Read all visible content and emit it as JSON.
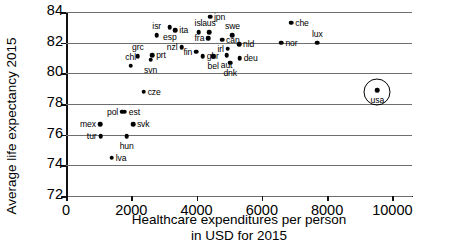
{
  "chart_data": {
    "type": "scatter",
    "title": "",
    "xlabel": "Healthcare expenditures per person in USD for 2015",
    "xlabel_line1": "Healthcare expenditures per person",
    "xlabel_line2": "in USD for 2015",
    "ylabel": "Average life expectancy 2015",
    "xlim": [
      0,
      10600
    ],
    "ylim": [
      72,
      84
    ],
    "xticks": [
      0,
      2000,
      4000,
      6000,
      8000,
      10000
    ],
    "xticklabels": [
      "0",
      "2000",
      "4000",
      "6000",
      "8000",
      "10000"
    ],
    "yticks": [
      72,
      74,
      76,
      78,
      80,
      82,
      84
    ],
    "yticklabels": [
      "72",
      "74",
      "76",
      "78",
      "80",
      "82",
      "84"
    ],
    "grid": "horizontal",
    "legend": "none",
    "marker_color": "#000000",
    "gridline_color": "#6e6e6e",
    "highlight": {
      "label": "usa",
      "x": 9540,
      "y": 78.9,
      "shape": "circle-annotation"
    },
    "points": [
      {
        "label": "tur",
        "x": 1060,
        "y": 75.9,
        "lpos": "left"
      },
      {
        "label": "mex",
        "x": 1040,
        "y": 76.7,
        "lpos": "left"
      },
      {
        "label": "lva",
        "x": 1400,
        "y": 74.5,
        "lpos": "right"
      },
      {
        "label": "pol",
        "x": 1720,
        "y": 77.5,
        "lpos": "left"
      },
      {
        "label": "est",
        "x": 1800,
        "y": 77.5,
        "lpos": "right"
      },
      {
        "label": "hun",
        "x": 1860,
        "y": 75.9,
        "lpos": "bottom"
      },
      {
        "label": "svk",
        "x": 2050,
        "y": 76.7,
        "lpos": "right"
      },
      {
        "label": "chl",
        "x": 1980,
        "y": 80.5,
        "lpos": "top"
      },
      {
        "label": "cze",
        "x": 2380,
        "y": 78.8,
        "lpos": "right"
      },
      {
        "label": "grc",
        "x": 2200,
        "y": 81.1,
        "lpos": "top"
      },
      {
        "label": "svn",
        "x": 2590,
        "y": 80.9,
        "lpos": "bottom"
      },
      {
        "label": "prt",
        "x": 2640,
        "y": 81.2,
        "lpos": "right"
      },
      {
        "label": "isr",
        "x": 2780,
        "y": 82.5,
        "lpos": "top"
      },
      {
        "label": "esp",
        "x": 3180,
        "y": 83.0,
        "lpos": "bottom"
      },
      {
        "label": "ita",
        "x": 3350,
        "y": 82.8,
        "lpos": "right"
      },
      {
        "label": "nzl",
        "x": 3540,
        "y": 81.7,
        "lpos": "left"
      },
      {
        "label": "fin",
        "x": 3990,
        "y": 81.4,
        "lpos": "left"
      },
      {
        "label": "isl",
        "x": 4060,
        "y": 82.7,
        "lpos": "top"
      },
      {
        "label": "jpn",
        "x": 4410,
        "y": 83.7,
        "lpos": "right"
      },
      {
        "label": "aus",
        "x": 4380,
        "y": 82.7,
        "lpos": "top"
      },
      {
        "label": "fra",
        "x": 4360,
        "y": 82.3,
        "lpos": "left"
      },
      {
        "label": "gbr",
        "x": 4190,
        "y": 81.1,
        "lpos": "right"
      },
      {
        "label": "bel",
        "x": 4510,
        "y": 81.1,
        "lpos": "bottom"
      },
      {
        "label": "can",
        "x": 4780,
        "y": 82.2,
        "lpos": "right"
      },
      {
        "label": "irl",
        "x": 4960,
        "y": 81.6,
        "lpos": "left"
      },
      {
        "label": "aut",
        "x": 4920,
        "y": 81.2,
        "lpos": "bottom"
      },
      {
        "label": "dnk",
        "x": 5030,
        "y": 80.7,
        "lpos": "bottom"
      },
      {
        "label": "swe",
        "x": 5100,
        "y": 82.5,
        "lpos": "top"
      },
      {
        "label": "nld",
        "x": 5300,
        "y": 81.9,
        "lpos": "right"
      },
      {
        "label": "deu",
        "x": 5320,
        "y": 81.0,
        "lpos": "right"
      },
      {
        "label": "nor",
        "x": 6600,
        "y": 82.0,
        "lpos": "right"
      },
      {
        "label": "che",
        "x": 6900,
        "y": 83.3,
        "lpos": "right"
      },
      {
        "label": "lux",
        "x": 7700,
        "y": 82.0,
        "lpos": "top"
      }
    ]
  }
}
